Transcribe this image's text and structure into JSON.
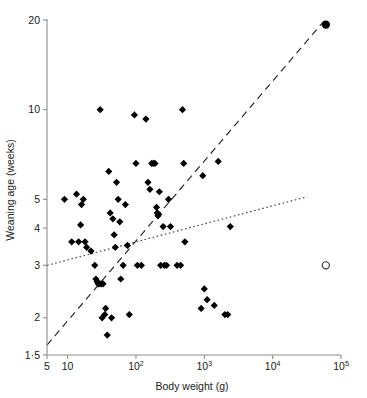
{
  "chart_data": {
    "type": "scatter",
    "title": "",
    "xlabel": "Body weight (g)",
    "ylabel": "Weaning age (weeks)",
    "xscale": "log",
    "yscale": "log",
    "xlim": [
      5,
      100000
    ],
    "ylim": [
      1.5,
      20
    ],
    "grid": false,
    "legend": "none",
    "x_tick_labels": [
      "5",
      "10",
      "10^2",
      "10^3",
      "10^4",
      "10^5"
    ],
    "x_tick_values": [
      5,
      10,
      100,
      1000,
      10000,
      100000
    ],
    "y_tick_labels": [
      "20",
      "10",
      "5",
      "4",
      "3",
      "2",
      "1.5"
    ],
    "y_tick_values": [
      20,
      10,
      5,
      4,
      3,
      2,
      1.5
    ],
    "series": [
      {
        "name": "Non-human mammals",
        "marker": "filled-diamond",
        "color": "#000000",
        "points": [
          [
            9.0,
            5.0
          ],
          [
            11.5,
            3.6
          ],
          [
            13.5,
            5.2
          ],
          [
            14.5,
            3.6
          ],
          [
            15.5,
            4.1
          ],
          [
            16.0,
            4.8
          ],
          [
            17.0,
            5.0
          ],
          [
            18.0,
            3.6
          ],
          [
            19.0,
            3.45
          ],
          [
            22.0,
            3.35
          ],
          [
            25.0,
            3.0
          ],
          [
            26.0,
            2.7
          ],
          [
            27.0,
            2.65
          ],
          [
            28.0,
            2.6
          ],
          [
            29.0,
            2.6
          ],
          [
            30.0,
            10.0
          ],
          [
            31.0,
            2.6
          ],
          [
            32.0,
            2.0
          ],
          [
            33.0,
            2.6
          ],
          [
            35.0,
            2.05
          ],
          [
            36.0,
            2.15
          ],
          [
            38.0,
            1.75
          ],
          [
            40.0,
            6.2
          ],
          [
            42.0,
            4.5
          ],
          [
            44.0,
            2.0
          ],
          [
            46.0,
            4.3
          ],
          [
            48.0,
            3.8
          ],
          [
            50.0,
            3.45
          ],
          [
            52.0,
            5.7
          ],
          [
            55.0,
            5.0
          ],
          [
            58.0,
            4.2
          ],
          [
            60.0,
            2.7
          ],
          [
            65.0,
            3.0
          ],
          [
            70.0,
            4.8
          ],
          [
            75.0,
            3.5
          ],
          [
            80.0,
            2.05
          ],
          [
            95.0,
            9.6
          ],
          [
            100.0,
            6.6
          ],
          [
            105.0,
            3.0
          ],
          [
            120.0,
            3.0
          ],
          [
            140.0,
            9.3
          ],
          [
            150.0,
            5.7
          ],
          [
            160.0,
            5.4
          ],
          [
            170.0,
            6.6
          ],
          [
            180.0,
            6.6
          ],
          [
            190.0,
            6.6
          ],
          [
            200.0,
            4.7
          ],
          [
            205.0,
            4.5
          ],
          [
            210.0,
            4.4
          ],
          [
            215.0,
            4.45
          ],
          [
            220.0,
            5.3
          ],
          [
            230.0,
            3.0
          ],
          [
            250.0,
            4.05
          ],
          [
            260.0,
            3.0
          ],
          [
            280.0,
            3.0
          ],
          [
            300.0,
            5.0
          ],
          [
            320.0,
            4.05
          ],
          [
            400.0,
            3.0
          ],
          [
            450.0,
            3.0
          ],
          [
            480.0,
            10.0
          ],
          [
            500.0,
            6.6
          ],
          [
            520.0,
            3.6
          ],
          [
            900.0,
            2.15
          ],
          [
            950.0,
            6.0
          ],
          [
            1000.0,
            2.5
          ],
          [
            1100.0,
            2.3
          ],
          [
            1400.0,
            2.2
          ],
          [
            1600.0,
            6.7
          ],
          [
            2000.0,
            2.05
          ],
          [
            2200.0,
            2.05
          ],
          [
            2400.0,
            4.05
          ]
        ]
      },
      {
        "name": "Modern human",
        "marker": "filled-circle",
        "color": "#000000",
        "points": [
          [
            60000.0,
            19.3
          ]
        ]
      },
      {
        "name": "Human (observed weaning)",
        "marker": "open-circle",
        "color": "#3a3a3a",
        "points": [
          [
            60000.0,
            3.0
          ]
        ]
      }
    ],
    "fit_lines": [
      {
        "name": "dashed-regression",
        "style": "dashed",
        "x_start": 5,
        "y_start": 1.62,
        "x_end": 56000,
        "y_end": 19.8
      },
      {
        "name": "dotted-regression",
        "style": "dotted",
        "x_start": 5,
        "y_start": 3.0,
        "x_end": 32000,
        "y_end": 5.1
      }
    ]
  },
  "axes": {
    "x_title": "Body weight (g)",
    "y_title": "Weaning age (weeks)",
    "x_ticks": [
      {
        "label": "5",
        "sup": "",
        "value": 5
      },
      {
        "label": "10",
        "sup": "",
        "value": 10
      },
      {
        "label": "10",
        "sup": "2",
        "value": 100
      },
      {
        "label": "10",
        "sup": "3",
        "value": 1000
      },
      {
        "label": "10",
        "sup": "4",
        "value": 10000
      },
      {
        "label": "10",
        "sup": "5",
        "value": 100000
      }
    ],
    "y_ticks": [
      {
        "label": "20",
        "value": 20
      },
      {
        "label": "10",
        "value": 10
      },
      {
        "label": "5",
        "value": 5
      },
      {
        "label": "4",
        "value": 4
      },
      {
        "label": "3",
        "value": 3
      },
      {
        "label": "2",
        "value": 2
      },
      {
        "label": "1·5",
        "value": 1.5
      }
    ]
  }
}
